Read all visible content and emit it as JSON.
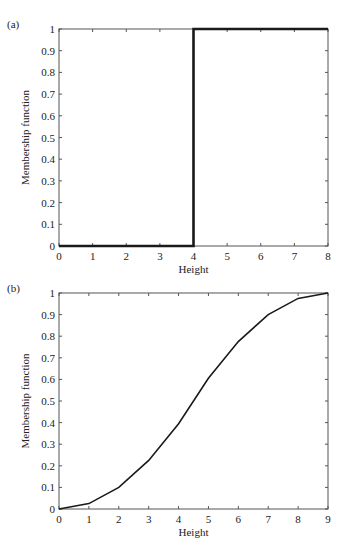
{
  "chart_data": [
    {
      "panel": "(a)",
      "type": "line",
      "title": "",
      "xlabel": "Height",
      "ylabel": "Membership function",
      "xlim": [
        0,
        8
      ],
      "ylim": [
        0,
        1
      ],
      "xticks": [
        0,
        1,
        2,
        3,
        4,
        5,
        6,
        7,
        8
      ],
      "yticks": [
        0,
        0.1,
        0.2,
        0.3,
        0.4,
        0.5,
        0.6,
        0.7,
        0.8,
        0.9,
        1
      ],
      "ytick_labels": [
        "0",
        "0.1",
        "0.2",
        "0.3",
        "0.4",
        "0.5",
        "0.6",
        "0.7",
        "0.8",
        "0.9",
        "1"
      ],
      "grid": false,
      "series": [
        {
          "name": "crisp step",
          "x": [
            0,
            4,
            4,
            8
          ],
          "y": [
            0,
            0,
            1,
            1
          ]
        }
      ]
    },
    {
      "panel": "(b)",
      "type": "line",
      "title": "",
      "xlabel": "Height",
      "ylabel": "Membership function",
      "xlim": [
        0,
        9
      ],
      "ylim": [
        0,
        1
      ],
      "xticks": [
        0,
        1,
        2,
        3,
        4,
        5,
        6,
        7,
        8,
        9
      ],
      "yticks": [
        0,
        0.1,
        0.2,
        0.3,
        0.4,
        0.5,
        0.6,
        0.7,
        0.8,
        0.9,
        1
      ],
      "ytick_labels": [
        "0",
        "0.1",
        "0.2",
        "0.3",
        "0.4",
        "0.5",
        "0.6",
        "0.7",
        "0.8",
        "0.9",
        "1"
      ],
      "grid": false,
      "series": [
        {
          "name": "fuzzy S-curve",
          "x": [
            0,
            1,
            2,
            3,
            4,
            5,
            6,
            7,
            8,
            9
          ],
          "y": [
            0,
            0.025,
            0.1,
            0.225,
            0.395,
            0.605,
            0.775,
            0.9,
            0.975,
            1
          ]
        }
      ]
    }
  ]
}
